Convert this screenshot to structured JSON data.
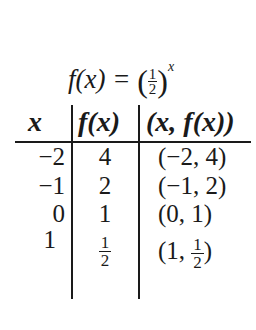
{
  "title": {
    "lhs": "f(x) =",
    "base_numerator": "1",
    "base_denominator": "2",
    "exponent": "x",
    "open_paren": "(",
    "close_paren": ")"
  },
  "table": {
    "headers": [
      "x",
      "f(x)",
      "(x, f(x))"
    ],
    "rows": [
      {
        "x": "−2",
        "fx": "4",
        "pair": "(−2, 4)"
      },
      {
        "x": "−1",
        "fx": "2",
        "pair": "(−1, 2)"
      },
      {
        "x": "0",
        "fx": "1",
        "pair": "(0, 1)"
      },
      {
        "x": "1",
        "fx_num": "1",
        "fx_den": "2",
        "pair_open": "(1,",
        "pair_num": "1",
        "pair_den": "2",
        "pair_close": ")"
      }
    ]
  }
}
